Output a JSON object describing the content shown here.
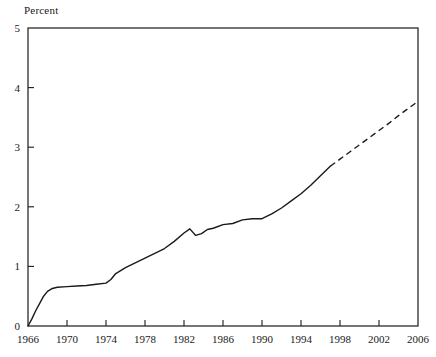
{
  "chart_data": {
    "type": "line",
    "title": "",
    "ylabel": "Percent",
    "xlabel": "",
    "ylim": [
      0,
      5
    ],
    "xlim": [
      1966,
      2006
    ],
    "grid": false,
    "legend": null,
    "yticks": [
      "0",
      "1",
      "2",
      "3",
      "4",
      "5"
    ],
    "ytick_values": [
      0,
      1,
      2,
      3,
      4,
      5
    ],
    "xticks": [
      "1966",
      "1970",
      "1974",
      "1978",
      "1982",
      "1986",
      "1990",
      "1994",
      "1998",
      "2002",
      "2006"
    ],
    "xtick_values": [
      1966,
      1970,
      1974,
      1978,
      1982,
      1986,
      1990,
      1994,
      1998,
      2002,
      2006
    ],
    "line_color": "#1a1a1a",
    "series": [
      {
        "name": "Percent (actual)",
        "style": "solid",
        "x": [
          1966,
          1966.4,
          1966.8,
          1967.2,
          1967.6,
          1968,
          1968.5,
          1969,
          1970,
          1971,
          1972,
          1973,
          1974,
          1974.5,
          1975,
          1976,
          1977,
          1978,
          1979,
          1980,
          1981,
          1982,
          1982.6,
          1983.2,
          1983.8,
          1984.4,
          1985,
          1986,
          1987,
          1988,
          1989,
          1990,
          1991,
          1992,
          1993,
          1994,
          1995,
          1996,
          1997
        ],
        "y": [
          0.0,
          0.12,
          0.26,
          0.38,
          0.5,
          0.58,
          0.63,
          0.65,
          0.66,
          0.67,
          0.68,
          0.7,
          0.72,
          0.78,
          0.88,
          0.98,
          1.06,
          1.14,
          1.22,
          1.3,
          1.42,
          1.56,
          1.63,
          1.52,
          1.55,
          1.62,
          1.64,
          1.7,
          1.72,
          1.78,
          1.8,
          1.8,
          1.88,
          1.98,
          2.1,
          2.22,
          2.36,
          2.52,
          2.68
        ]
      },
      {
        "name": "Percent (projected)",
        "style": "dashed",
        "x": [
          1997,
          1998,
          1999,
          2000,
          2001,
          2002,
          2003,
          2004,
          2005,
          2006
        ],
        "y": [
          2.68,
          2.8,
          2.92,
          3.04,
          3.16,
          3.28,
          3.4,
          3.53,
          3.65,
          3.77
        ]
      }
    ]
  }
}
